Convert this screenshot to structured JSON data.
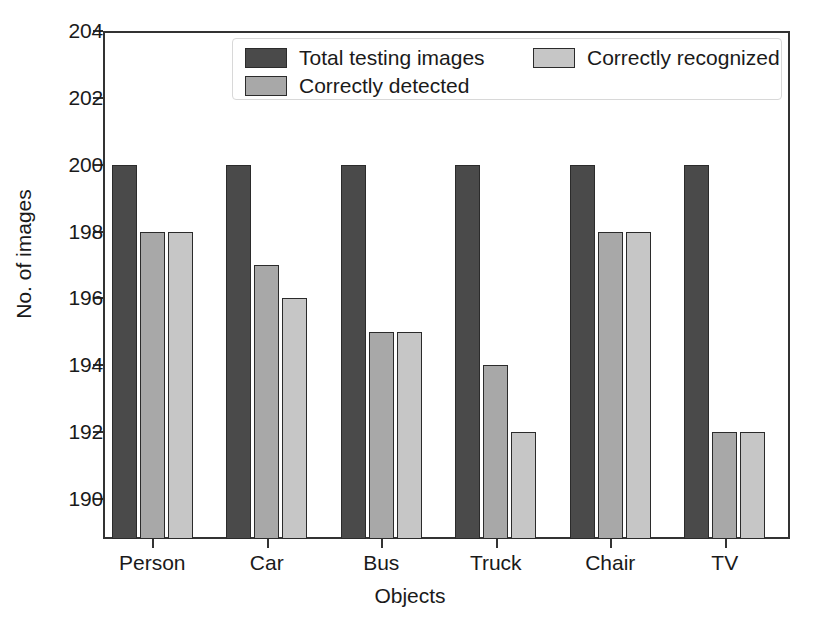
{
  "chart_data": {
    "type": "bar",
    "title": "",
    "xlabel": "Objects",
    "ylabel": "No. of images",
    "categories": [
      "Person",
      "Car",
      "Bus",
      "Truck",
      "Chair",
      "TV"
    ],
    "series": [
      {
        "name": "Total testing images",
        "color": "#4a4a4a",
        "values": [
          200,
          200,
          200,
          200,
          200,
          200
        ]
      },
      {
        "name": "Correctly detected",
        "color": "#a8a8a8",
        "values": [
          198,
          197,
          195,
          194,
          198,
          192
        ]
      },
      {
        "name": "Correctly recognized",
        "color": "#c6c6c6",
        "values": [
          198,
          196,
          195,
          192,
          198,
          192
        ]
      }
    ],
    "ylim": [
      188.8,
      204
    ],
    "yticks": [
      190,
      192,
      194,
      196,
      198,
      200,
      202,
      204
    ],
    "ytick_labels": [
      "190",
      "192",
      "194",
      "196",
      "198",
      "200",
      "202",
      "204"
    ],
    "xtick_labels": [
      "Person",
      "Car",
      "Bus",
      "Truck",
      "Chair",
      "TV"
    ],
    "grid": false,
    "legend_position": "upper-center",
    "legend_entries": [
      "Total testing images",
      "Correctly detected",
      "Correctly recognized"
    ]
  },
  "axes": {
    "frame_color": "#333333",
    "background": "#ffffff"
  }
}
